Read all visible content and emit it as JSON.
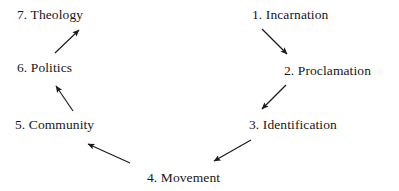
{
  "diagram": {
    "type": "cycle-flow-diagram",
    "canvas": {
      "width": 399,
      "height": 191
    },
    "background_color": "#ffffff",
    "text_color": "#171717",
    "arrow_color": "#1a1a1a",
    "nodes": [
      {
        "id": "incarnation",
        "label": "1. Incarnation",
        "x": 252,
        "y": 7
      },
      {
        "id": "proclamation",
        "label": "2. Proclamation",
        "x": 284,
        "y": 63
      },
      {
        "id": "identification",
        "label": "3. Identification",
        "x": 249,
        "y": 117
      },
      {
        "id": "movement",
        "label": "4. Movement",
        "x": 147,
        "y": 170
      },
      {
        "id": "community",
        "label": "5. Community",
        "x": 15,
        "y": 117
      },
      {
        "id": "politics",
        "label": "6. Politics",
        "x": 17,
        "y": 60
      },
      {
        "id": "theology",
        "label": "7. Theology",
        "x": 17,
        "y": 7
      }
    ],
    "arrows": [
      {
        "id": "incarnation-to-proclamation",
        "from": "incarnation",
        "to": "proclamation",
        "x1": 262,
        "y1": 29,
        "x2": 287,
        "y2": 54
      },
      {
        "id": "proclamation-to-identification",
        "from": "proclamation",
        "to": "identification",
        "x1": 286,
        "y1": 85,
        "x2": 262,
        "y2": 109
      },
      {
        "id": "identification-to-movement",
        "from": "identification",
        "to": "movement",
        "x1": 251,
        "y1": 140,
        "x2": 214,
        "y2": 161
      },
      {
        "id": "movement-to-community",
        "from": "movement",
        "to": "community",
        "x1": 130,
        "y1": 163,
        "x2": 88,
        "y2": 144
      },
      {
        "id": "community-to-politics",
        "from": "community",
        "to": "politics",
        "x1": 73,
        "y1": 111,
        "x2": 56,
        "y2": 86
      },
      {
        "id": "politics-to-theology",
        "from": "politics",
        "to": "theology",
        "x1": 55,
        "y1": 53,
        "x2": 79,
        "y2": 30
      }
    ]
  }
}
